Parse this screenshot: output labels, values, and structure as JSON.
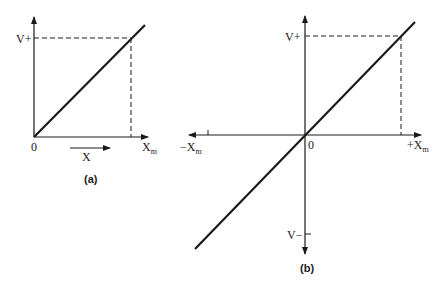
{
  "figure_a": {
    "caption": "(a)",
    "y_label_top": "V+",
    "origin_label": "0",
    "x_end_label": "X",
    "x_end_sub": "m",
    "x_arrow_label": "X"
  },
  "figure_b": {
    "caption": "(b)",
    "y_label_top": "V+",
    "y_label_bottom": "V−",
    "origin_label": "0",
    "x_pos_label": "+X",
    "x_pos_sub": "m",
    "x_neg_label": "−X",
    "x_neg_sub": "m"
  },
  "colors": {
    "stroke": "#1a1a1a",
    "background": "#ffffff"
  }
}
